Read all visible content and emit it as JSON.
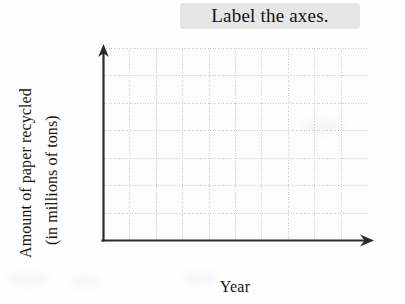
{
  "instruction": {
    "text": "Label the axes.",
    "highlight_color": "#e6e6e6"
  },
  "axes": {
    "y_label_line_1": "Amount of paper recycled",
    "y_label_line_2": "(in millions of tons)",
    "x_label": "Year",
    "axis_color": "#2b2b2b",
    "arrow_on_x": true,
    "arrow_on_y": true
  },
  "chart_data": {
    "type": "line",
    "title": "Label the axes.",
    "xlabel": "Year",
    "ylabel": "Amount of paper recycled (in millions of tons)",
    "series": [],
    "x": [],
    "categories": [],
    "values": [],
    "xlim": [
      0,
      10
    ],
    "ylim": [
      0,
      7
    ],
    "grid": true,
    "grid_columns": 10,
    "grid_rows": 7,
    "grid_style": "dotted",
    "grid_color": "#c9c9c9",
    "tick_labels_x": [],
    "tick_labels_y": [],
    "legend": [],
    "legend_position": "none",
    "annotations": [
      "Label the axes."
    ],
    "note": "Empty grid worksheet: no data plotted, axes unlabeled with numeric ticks"
  }
}
